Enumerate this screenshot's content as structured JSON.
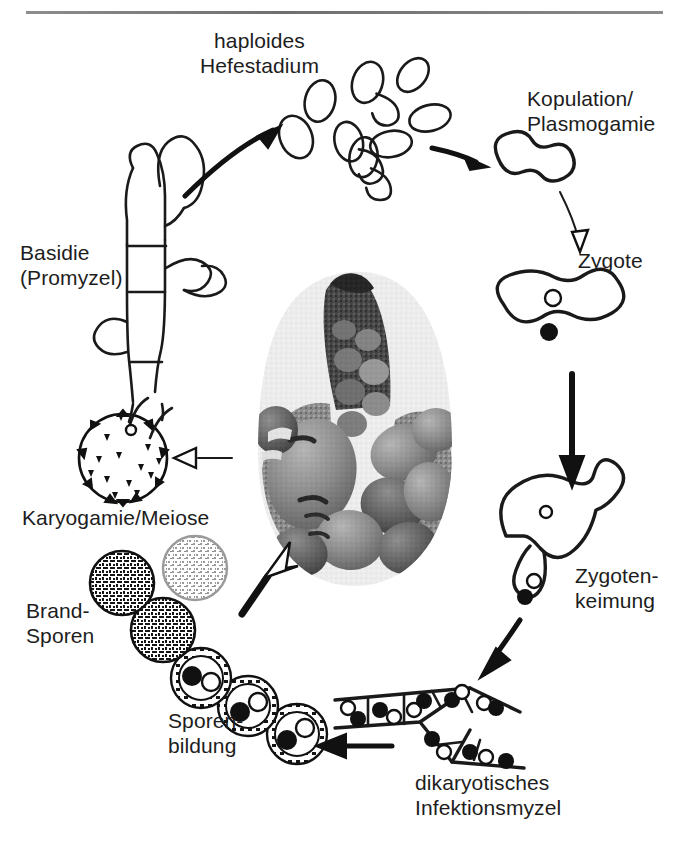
{
  "figure": {
    "language": "de",
    "style": "hand-drawn line diagram with central halftone photograph",
    "cycle_direction": "clockwise"
  },
  "labels": {
    "haploides_hefestadium": "haploides\nHefestadium",
    "kopulation_plasmogamie": "Kopulation/\nPlasmogamie",
    "zygote": "Zygote",
    "zygotenkeimung": "Zygoten-\nkeimung",
    "dikaryotisches_infektionsmyzel": "dikaryotisches\nInfektionsmyzel",
    "sporenbildung": "Sporen-\nbildung",
    "brandsporen": "Brand-\nSporen",
    "karyogamie_meiose": "Karyogamie/Meiose",
    "basidie_promyzel": "Basidie\n(Promyzel)"
  },
  "stages": [
    {
      "id": "haploides-hefestadium",
      "label": "haploides Hefestadium",
      "description": "cluster of budding haploid yeast cells (sporidia)",
      "count": 8,
      "nuclei_per_cell": 0
    },
    {
      "id": "kopulation-plasmogamie",
      "label": "Kopulation/Plasmogamie",
      "description": "two compatible yeast cells fusing",
      "count": 2
    },
    {
      "id": "zygote",
      "label": "Zygote",
      "description": "dumbbell-shaped dikaryotic zygote",
      "nuclei": [
        {
          "type": "open"
        },
        {
          "type": "filled"
        }
      ]
    },
    {
      "id": "zygotenkeimung",
      "label": "Zygotenkeimung",
      "description": "zygote producing a germ tube with migrating nuclei",
      "nuclei": [
        {
          "type": "open"
        },
        {
          "type": "filled"
        }
      ]
    },
    {
      "id": "dikaryotisches-infektionsmyzel",
      "label": "dikaryotisches Infektionsmyzel",
      "description": "septate branching hypha, each cell with a nucleus pair",
      "nuclei_per_cell": 2
    },
    {
      "id": "sporenbildung",
      "label": "Sporenbildung",
      "description": "chain of young spores maturing, each with two nuclei"
    },
    {
      "id": "brand-sporen",
      "label": "Brand-Sporen",
      "description": "mature dark stippled teliospores (smut spores)",
      "count": 3
    },
    {
      "id": "karyogamie-meiose",
      "label": "Karyogamie/Meiose",
      "description": "spiny germinating teliospore"
    },
    {
      "id": "basidie-promyzel",
      "label": "Basidie (Promyzel)",
      "description": "septate basidium bearing lateral sporidia buds",
      "septa": 2
    }
  ],
  "photo": {
    "name": "maize-ear-with-smut-galls",
    "caption": "Maiskolben mit Brandbeulen",
    "shape": "oval",
    "tone": "grayscale halftone"
  },
  "arrows": [
    {
      "from": "basidie-promyzel",
      "to": "haploides-hefestadium",
      "fill": "solid"
    },
    {
      "from": "haploides-hefestadium",
      "to": "kopulation-plasmogamie",
      "fill": "solid"
    },
    {
      "from": "kopulation-plasmogamie",
      "to": "zygote",
      "fill": "open"
    },
    {
      "from": "zygote",
      "to": "zygotenkeimung",
      "fill": "solid"
    },
    {
      "from": "zygotenkeimung",
      "to": "dikaryotisches-infektionsmyzel",
      "fill": "solid"
    },
    {
      "from": "dikaryotisches-infektionsmyzel",
      "to": "sporenbildung",
      "fill": "solid"
    },
    {
      "from": "sporenbildung",
      "to": "maize-ear-with-smut-galls",
      "fill": "open"
    },
    {
      "from": "brand-sporen",
      "to": "karyogamie-meiose",
      "fill": "open"
    }
  ],
  "colors": {
    "ink": "#1a1a1a",
    "paper": "#ffffff",
    "rule": "#7d7d7d",
    "photo_dark": "#2c2c2c",
    "photo_mid": "#8a8a8a",
    "photo_light": "#cfcfcf"
  }
}
